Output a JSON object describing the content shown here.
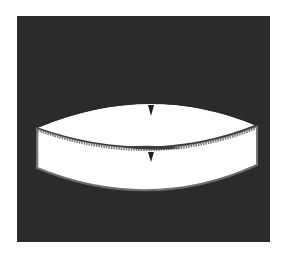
{
  "figure": {
    "colors": {
      "page_background": "#ffffff",
      "panel_background": "#2b2b2b",
      "shape_fill": "#ffffff",
      "outline": "#6e6e6e",
      "marker": "#1e1e1e"
    },
    "markers": [
      {
        "name": "upper-center-marker",
        "shape": "triangle-down"
      },
      {
        "name": "lower-center-marker",
        "shape": "triangle-down"
      }
    ]
  }
}
